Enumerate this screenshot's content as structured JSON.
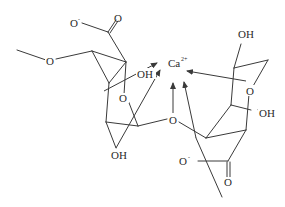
{
  "diagram": {
    "type": "chemical-structure",
    "colors": {
      "line": "#3a3a3a",
      "text": "#2a2a2a",
      "background": "#ffffff"
    },
    "labels": {
      "carboxylate_o_minus_left": "O",
      "carboxylate_o_minus_left_charge": "-",
      "carbonyl_o_left": "O",
      "methoxy_o": "O",
      "ring_o_left": "O",
      "oh_left_upper": "OH",
      "oh_left_lower": "OH",
      "calcium": "Ca",
      "calcium_charge": "2+",
      "glycosidic_o": "O",
      "oh_right_top": "OH",
      "ring_o_right": "O",
      "oh_right_mid": "OH",
      "carboxylate_o_minus_right": "O",
      "carboxylate_o_minus_right_charge": "-",
      "carbonyl_o_right": "O"
    }
  }
}
